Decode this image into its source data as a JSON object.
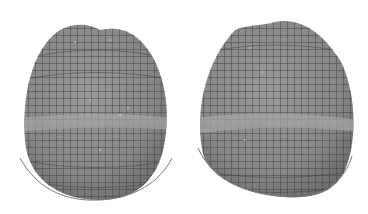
{
  "figure": {
    "colors": {
      "background": "#ffffff",
      "surface": "#8c8c8c",
      "surface_light": "#a6a6a6",
      "grid_lines": "#3c3c3c",
      "outline_arc": "#7a7a7a"
    },
    "panels": [
      {
        "id": "left",
        "label": ""
      },
      {
        "id": "right",
        "label": ""
      }
    ]
  }
}
